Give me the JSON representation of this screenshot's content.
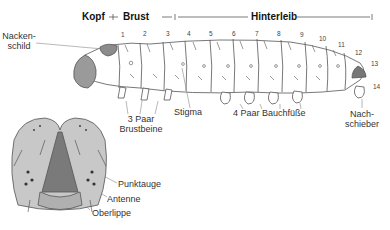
{
  "header": {
    "head": "Kopf",
    "thorax": "Brust",
    "abdomen": "Hinterleib"
  },
  "labels": {
    "neck_shield": "Nacken-\nschild",
    "neck_shield_l1": "Nacken-",
    "neck_shield_l2": "schild",
    "thoracic_legs_l1": "3 Paar",
    "thoracic_legs_l2": "Brustbeine",
    "spiracle": "Stigma",
    "prolegs": "4 Paar Bauchfüße",
    "anal_prolegs_l1": "Nach-",
    "anal_prolegs_l2": "schieber",
    "ocellus": "Punktauge",
    "antenna": "Antenne",
    "labrum": "Oberlippe"
  },
  "segments": [
    "1",
    "2",
    "3",
    "4",
    "5",
    "6",
    "7",
    "8",
    "9",
    "10",
    "11",
    "12",
    "13",
    "14"
  ],
  "colors": {
    "body_fill": "#ffffff",
    "outline": "#555555",
    "shield_fill": "#8c8c8c",
    "head_fill": "#c8c8c8",
    "head_dark": "#7a7a7a"
  }
}
